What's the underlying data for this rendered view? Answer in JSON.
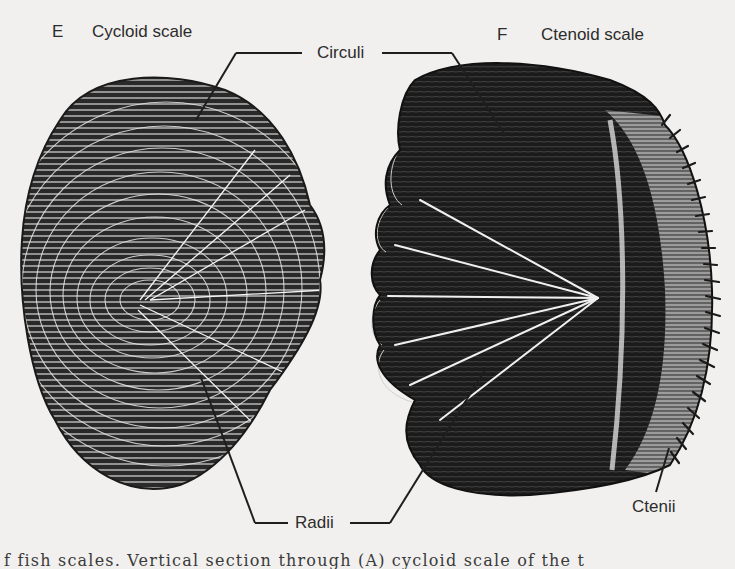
{
  "figure": {
    "panels": [
      {
        "letter": "E",
        "title": "Cycloid scale"
      },
      {
        "letter": "F",
        "title": "Ctenoid scale"
      }
    ],
    "callouts": {
      "circuli": "Circuli",
      "radii": "Radii",
      "ctenii": "Ctenii"
    },
    "caption_fragment": "f fish scales. Vertical section through (A) cycloid scale of the t"
  },
  "colors": {
    "background": "#f1f0ee",
    "ink": "#1e1e1e",
    "label_text": "#2c2c2c"
  }
}
